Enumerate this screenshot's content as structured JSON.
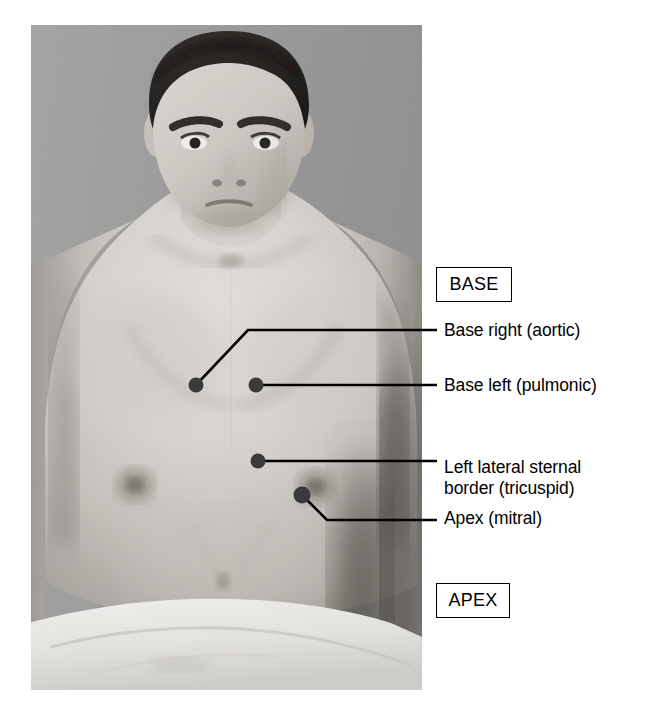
{
  "figure": {
    "photo_alt": "Grayscale photograph of a seated male subject, bare chest, draped below the waist"
  },
  "regions": [
    {
      "key": "base",
      "label": "BASE"
    },
    {
      "key": "apex",
      "label": "APEX"
    }
  ],
  "annotations": [
    {
      "key": "aortic",
      "label": "Base right (aortic)",
      "dot": {
        "x": 196,
        "y": 385,
        "r": 7.5
      },
      "leader": "M196,385 L248,330 L437,330"
    },
    {
      "key": "pulmonic",
      "label": "Base left (pulmonic)",
      "dot": {
        "x": 256,
        "y": 385,
        "r": 7.5
      },
      "leader": "M256,385 L437,385"
    },
    {
      "key": "tricuspid",
      "label": "Left lateral sternal\nborder (tricuspid)",
      "dot": {
        "x": 258,
        "y": 461,
        "r": 7.5
      },
      "leader": "M258,461 L437,461"
    },
    {
      "key": "mitral",
      "label": "Apex (mitral)",
      "dot": {
        "x": 302,
        "y": 495,
        "r": 8.5
      },
      "leader": "M302,495 L327,520 L437,520"
    }
  ],
  "colors": {
    "marker": "#3a3a3a",
    "leader": "#000000",
    "text": "#000000",
    "box_border": "#000000",
    "photo_background": "#9b9b9b",
    "page_background": "#ffffff"
  }
}
